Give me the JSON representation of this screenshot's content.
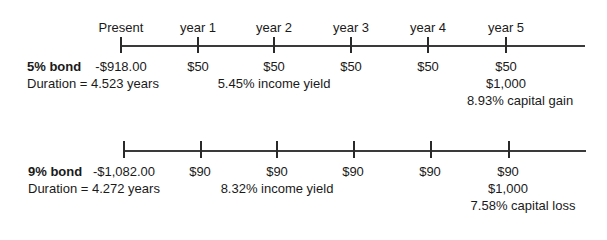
{
  "timeline": {
    "periods": [
      "Present",
      "year 1",
      "year 2",
      "year 3",
      "year 4",
      "year 5"
    ]
  },
  "bonds": [
    {
      "name": "5% bond",
      "duration": "Duration = 4.523 years",
      "cashflows": [
        "-$918.00",
        "$50",
        "$50",
        "$50",
        "$50",
        "$50"
      ],
      "principal": "$1,000",
      "income_yield": "5.45% income yield",
      "capital_note": "8.93% capital gain"
    },
    {
      "name": "9% bond",
      "duration": "Duration = 4.272 years",
      "cashflows": [
        "-$1,082.00",
        "$90",
        "$90",
        "$90",
        "$90",
        "$90"
      ],
      "principal": "$1,000",
      "income_yield": "8.32% income yield",
      "capital_note": "7.58% capital loss"
    }
  ]
}
